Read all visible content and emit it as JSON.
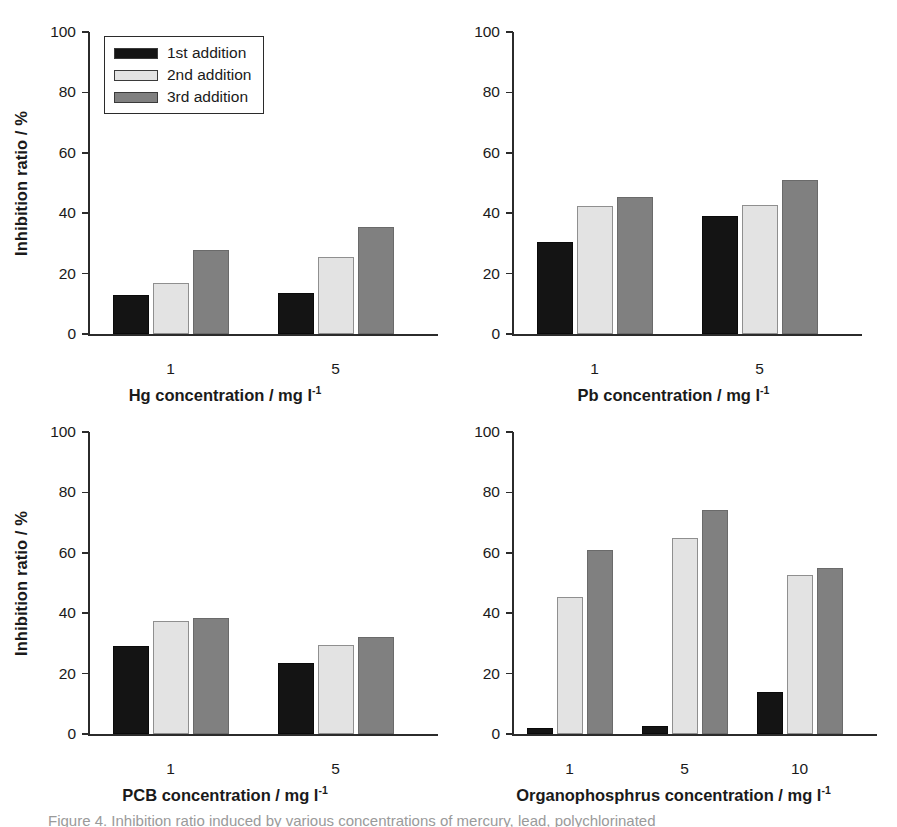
{
  "figure": {
    "legend": {
      "entries": [
        {
          "label": "1st addition",
          "color": "#141414",
          "key": "1st"
        },
        {
          "label": "2nd addition",
          "color": "#e3e3e3",
          "key": "2nd"
        },
        {
          "label": "3rd addition",
          "color": "#808080",
          "key": "3rd"
        }
      ]
    },
    "caption": "Figure 4. Inhibition ratio induced by various concentrations of mercury, lead, polychlorinated"
  },
  "chart_data": [
    {
      "type": "bar",
      "panel": "top-left",
      "title": "",
      "xlabel": "Hg concentration / mg l",
      "xlabel_superscript": "-1",
      "ylabel": "Inhibition ratio / %",
      "categories": [
        "1",
        "5"
      ],
      "ylim": [
        0,
        100
      ],
      "yticks": [
        0,
        20,
        40,
        60,
        80,
        100
      ],
      "grid": false,
      "legend_position": "upper-left",
      "series": [
        {
          "name": "1st addition",
          "color": "#141414",
          "values": [
            12.8,
            13.5
          ]
        },
        {
          "name": "2nd addition",
          "color": "#e3e3e3",
          "values": [
            17.0,
            25.5
          ]
        },
        {
          "name": "3rd addition",
          "color": "#808080",
          "values": [
            27.8,
            35.5
          ]
        }
      ]
    },
    {
      "type": "bar",
      "panel": "top-right",
      "title": "",
      "xlabel": "Pb concentration / mg l",
      "xlabel_superscript": "-1",
      "ylabel": "",
      "categories": [
        "1",
        "5"
      ],
      "ylim": [
        0,
        100
      ],
      "yticks": [
        0,
        20,
        40,
        60,
        80,
        100
      ],
      "grid": false,
      "legend_position": "none",
      "series": [
        {
          "name": "1st addition",
          "color": "#141414",
          "values": [
            30.3,
            39.0
          ]
        },
        {
          "name": "2nd addition",
          "color": "#e3e3e3",
          "values": [
            42.5,
            42.7
          ]
        },
        {
          "name": "3rd addition",
          "color": "#808080",
          "values": [
            45.4,
            51.0
          ]
        }
      ]
    },
    {
      "type": "bar",
      "panel": "bottom-left",
      "title": "",
      "xlabel": "PCB concentration / mg l",
      "xlabel_superscript": "-1",
      "ylabel": "Inhibition ratio / %",
      "categories": [
        "1",
        "5"
      ],
      "ylim": [
        0,
        100
      ],
      "yticks": [
        0,
        20,
        40,
        60,
        80,
        100
      ],
      "grid": false,
      "legend_position": "none",
      "series": [
        {
          "name": "1st addition",
          "color": "#141414",
          "values": [
            29.2,
            23.6
          ]
        },
        {
          "name": "2nd addition",
          "color": "#e3e3e3",
          "values": [
            37.4,
            29.4
          ]
        },
        {
          "name": "3rd addition",
          "color": "#808080",
          "values": [
            38.3,
            32.2
          ]
        }
      ]
    },
    {
      "type": "bar",
      "panel": "bottom-right",
      "title": "",
      "xlabel": "Organophosphrus concentration / mg l",
      "xlabel_superscript": "-1",
      "ylabel": "",
      "categories": [
        "1",
        "5",
        "10"
      ],
      "ylim": [
        0,
        100
      ],
      "yticks": [
        0,
        20,
        40,
        60,
        80,
        100
      ],
      "grid": false,
      "legend_position": "none",
      "series": [
        {
          "name": "1st addition",
          "color": "#141414",
          "values": [
            2.0,
            2.5,
            14.0
          ]
        },
        {
          "name": "2nd addition",
          "color": "#e3e3e3",
          "values": [
            45.5,
            64.8,
            52.8
          ]
        },
        {
          "name": "3rd addition",
          "color": "#808080",
          "values": [
            61.0,
            74.3,
            55.0
          ]
        }
      ]
    }
  ]
}
